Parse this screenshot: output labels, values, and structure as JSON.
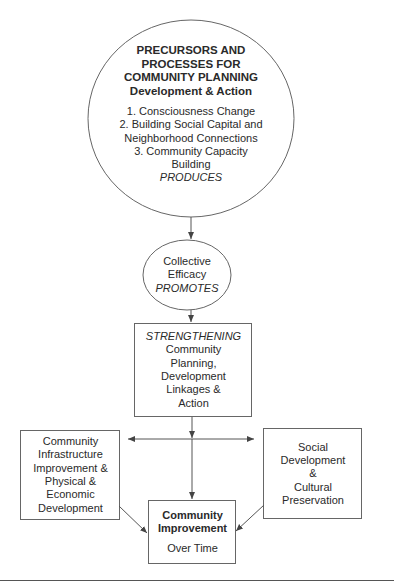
{
  "diagram": {
    "precursors": {
      "title_lines": [
        "PRECURSORS AND",
        "PROCESSES FOR",
        "COMMUNITY PLANNING",
        "Development & Action"
      ],
      "items": [
        "1. Consciousness Change",
        "2. Building Social Capital and",
        "Neighborhood Connections",
        "3. Community Capacity",
        "Building"
      ],
      "verb": "PRODUCES"
    },
    "efficacy": {
      "lines": [
        "Collective",
        "Efficacy"
      ],
      "verb": "PROMOTES"
    },
    "strengthening": {
      "verb": "STRENGTHENING",
      "lines": [
        "Community",
        "Planning,",
        "Development",
        "Linkages &",
        "Action"
      ]
    },
    "infrastructure": {
      "lines": [
        "Community",
        "Infrastructure",
        "Improvement &",
        "Physical &",
        "Economic",
        "Development"
      ]
    },
    "social": {
      "lines": [
        "Social",
        "Development",
        "&",
        "Cultural",
        "Preservation"
      ]
    },
    "improvement": {
      "title_lines": [
        "Community",
        "Improvement"
      ],
      "subtitle": "Over Time"
    },
    "colors": {
      "line": "#555555",
      "text": "#2a2a2a"
    }
  }
}
